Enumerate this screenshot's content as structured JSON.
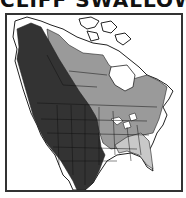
{
  "title": "CLIFF SWALLOW",
  "map": {
    "region": "North America",
    "legend_colors": {
      "dark_range": "#333333",
      "medium_range": "#9a9a9a",
      "light_range": "#c8c8c8",
      "land": "#ffffff",
      "border": "#222222"
    }
  }
}
